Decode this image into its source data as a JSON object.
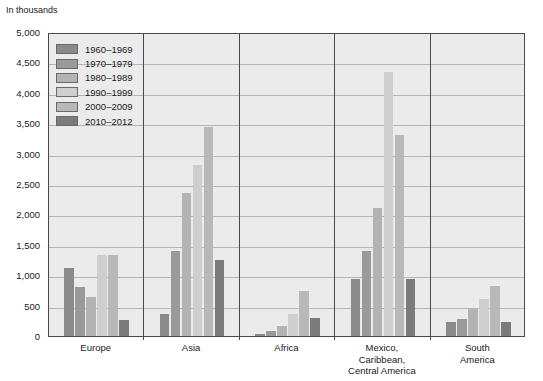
{
  "unit_caption": "In thousands",
  "legend": {
    "position": "top-left-inside",
    "entries": [
      {
        "label": "1960–1969",
        "color": "#8a8a8a"
      },
      {
        "label": "1970–1979",
        "color": "#9a9a9a"
      },
      {
        "label": "1980–1989",
        "color": "#b3b3b3"
      },
      {
        "label": "1990–1999",
        "color": "#cecece"
      },
      {
        "label": "2000–2009",
        "color": "#b8b8b8"
      },
      {
        "label": "2010–2012",
        "color": "#7b7b7b"
      }
    ]
  },
  "axes": {
    "y_ticks": [
      "0",
      "500",
      "1,000",
      "1,500",
      "2,000",
      "2,500",
      "3,000",
      "3,500",
      "4,000",
      "4,500",
      "5,000"
    ],
    "x_categories": [
      "Europe",
      "Asia",
      "Africa",
      "Mexico,\nCaribbean,\nCentral America",
      "South\nAmerica"
    ]
  },
  "chart_data": {
    "type": "bar",
    "title": "",
    "subtitle": "",
    "xlabel": "",
    "ylabel": "In thousands",
    "ylim": [
      0,
      5000
    ],
    "ytick_step": 500,
    "grid": true,
    "legend_position": "top-left-inside",
    "categories": [
      "Europe",
      "Asia",
      "Africa",
      "Mexico, Caribbean, Central America",
      "South America"
    ],
    "series": [
      {
        "name": "1960–1969",
        "color": "#8a8a8a",
        "values": [
          1120,
          360,
          30,
          940,
          230
        ]
      },
      {
        "name": "1970–1979",
        "color": "#9a9a9a",
        "values": [
          800,
          1400,
          80,
          1400,
          280
        ]
      },
      {
        "name": "1980–1989",
        "color": "#b3b3b3",
        "values": [
          640,
          2360,
          170,
          2110,
          450
        ]
      },
      {
        "name": "1990–1999",
        "color": "#cecece",
        "values": [
          1340,
          2810,
          360,
          4340,
          610
        ]
      },
      {
        "name": "2000–2009",
        "color": "#b8b8b8",
        "values": [
          1340,
          3430,
          740,
          3300,
          830
        ]
      },
      {
        "name": "2010–2012",
        "color": "#7b7b7b",
        "values": [
          260,
          1250,
          290,
          930,
          230
        ]
      }
    ]
  }
}
